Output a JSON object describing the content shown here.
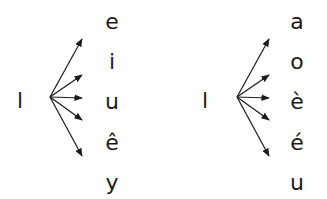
{
  "diagrams": [
    {
      "consonant": "l",
      "vowels": [
        "e",
        "i",
        "u",
        "ê",
        "y"
      ]
    },
    {
      "consonant": "l",
      "vowels": [
        "a",
        "o",
        "è",
        "é",
        "u"
      ]
    }
  ],
  "colors": {
    "ink": "#1a1a1a",
    "background": "#ffffff"
  }
}
